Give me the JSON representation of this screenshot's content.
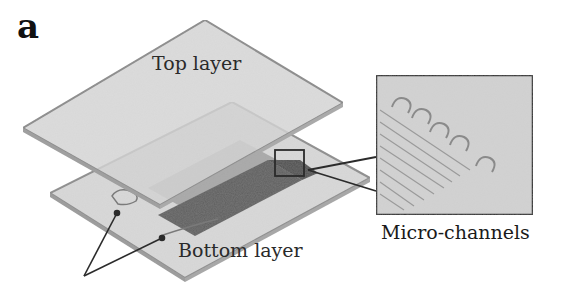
{
  "figure": {
    "panel_label": "a",
    "labels": {
      "top_layer": "Top layer",
      "bottom_layer": "Bottom layer",
      "micro_channels": "Micro-channels"
    },
    "components": [
      {
        "name": "top-layer-plate",
        "description": "Upper translucent plate"
      },
      {
        "name": "bottom-layer-plate",
        "description": "Lower plate"
      },
      {
        "name": "channel-region",
        "description": "Dark rectangular channel region between layers"
      },
      {
        "name": "zoom-inset",
        "description": "Magnified view of serpentine micro-channels"
      },
      {
        "name": "port-arrows",
        "description": "Two arrows pointing to inlet/outlet ports"
      }
    ],
    "colors": {
      "plate_fill": "#d6d6d6",
      "plate_edge": "#8a8a8a",
      "channel_light": "#a9a9a9",
      "channel_dark": "#5e5e5e",
      "outline": "#2b2b2b",
      "inset_fill": "#d3d3d3"
    }
  }
}
